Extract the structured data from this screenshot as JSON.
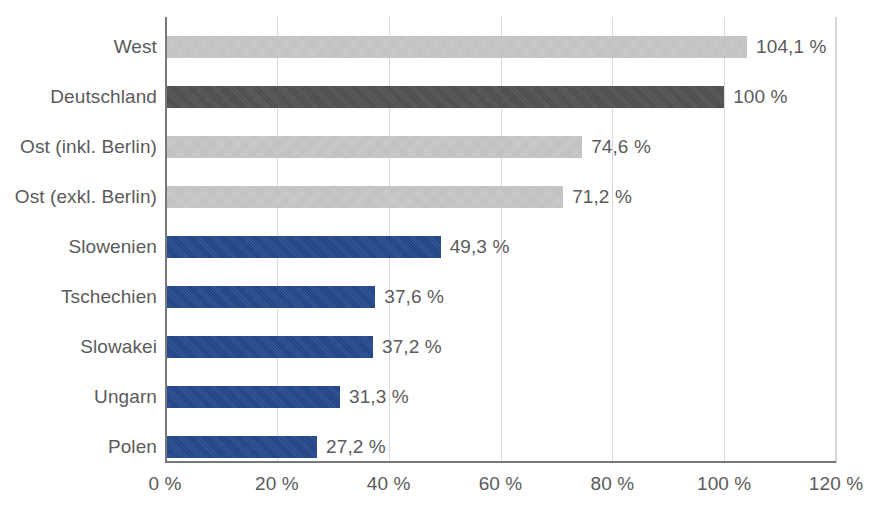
{
  "chart_data": {
    "type": "bar",
    "orientation": "horizontal",
    "title": "",
    "subtitle": "",
    "xlabel": "",
    "ylabel": "",
    "xlim": [
      0,
      120
    ],
    "xtick_values": [
      0,
      20,
      40,
      60,
      80,
      100,
      120
    ],
    "xtick_labels": [
      "0 %",
      "20 %",
      "40 %",
      "60 %",
      "80 %",
      "100 %",
      "120 %"
    ],
    "grid": true,
    "gridlines": "vertical",
    "legend": false,
    "legend_position": "none",
    "categories": [
      "West",
      "Deutschland",
      "Ost (inkl. Berlin)",
      "Ost (exkl. Berlin)",
      "Slowenien",
      "Tschechien",
      "Slowakei",
      "Ungarn",
      "Polen"
    ],
    "values": [
      104.1,
      100,
      74.6,
      71.2,
      49.3,
      37.6,
      37.2,
      31.3,
      27.2
    ],
    "value_labels": [
      "104,1 %",
      "100 %",
      "74,6 %",
      "71,2 %",
      "49,3 %",
      "37,6 %",
      "37,2 %",
      "31,3 %",
      "27,2 %"
    ],
    "bar_colors": [
      "#c6c6c6",
      "#4d4d4d",
      "#c6c6c6",
      "#c6c6c6",
      "#1f4489",
      "#1f4489",
      "#1f4489",
      "#1f4489",
      "#1f4489"
    ],
    "color_classes": [
      "c-gray-light",
      "c-gray-dark",
      "c-gray-light",
      "c-gray-light",
      "c-blue",
      "c-blue",
      "c-blue",
      "c-blue",
      "c-blue"
    ],
    "palette": {
      "gray_light": "#c6c6c6",
      "gray_dark": "#4d4d4d",
      "blue": "#1f4489",
      "gridline": "#dadada",
      "axis": "#77787a",
      "text": "#5b5b5b",
      "background": "#ffffff"
    }
  }
}
